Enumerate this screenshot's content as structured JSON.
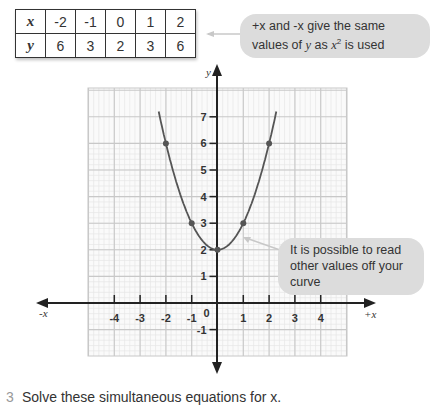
{
  "table": {
    "x_label": "x",
    "y_label": "y",
    "x_values": [
      "-2",
      "-1",
      "0",
      "1",
      "2"
    ],
    "y_values": [
      "6",
      "3",
      "2",
      "3",
      "6"
    ]
  },
  "callouts": {
    "symmetry_pre": "+x and -x give the same values of ",
    "symmetry_y": "y",
    "symmetry_mid": " as ",
    "symmetry_x": "x",
    "symmetry_sup": "2",
    "symmetry_post": " is used",
    "read_values": "It is possible to read other values off your curve"
  },
  "axes": {
    "x_pos_label": "+x",
    "x_neg_label": "-x",
    "y_label": "y",
    "x_ticks": [
      "-4",
      "-3",
      "-2",
      "-1",
      "0",
      "1",
      "2",
      "3",
      "4"
    ],
    "y_ticks": [
      "-1",
      "1",
      "2",
      "3",
      "4",
      "5",
      "6",
      "7"
    ]
  },
  "question": {
    "number": "3",
    "text": "Solve these simultaneous equations for x."
  },
  "colors": {
    "curve": "#555555",
    "axis": "#222222",
    "grid_major": "#c8c8c8",
    "grid_minor": "#e6e6e6",
    "callout_bg": "#dcdcdc"
  },
  "chart_data": {
    "type": "line",
    "title": "",
    "function": "y = x^2 + 2",
    "xlabel": "x",
    "ylabel": "y",
    "x": [
      -2,
      -1,
      0,
      1,
      2
    ],
    "y": [
      6,
      3,
      2,
      3,
      6
    ],
    "points_marked": [
      [
        -2,
        6
      ],
      [
        -1,
        3
      ],
      [
        0,
        2
      ],
      [
        1,
        3
      ],
      [
        2,
        6
      ]
    ],
    "xlim": [
      -5,
      5
    ],
    "ylim": [
      -2,
      8
    ],
    "x_ticks": [
      -4,
      -3,
      -2,
      -1,
      0,
      1,
      2,
      3,
      4
    ],
    "y_ticks": [
      -1,
      1,
      2,
      3,
      4,
      5,
      6,
      7
    ],
    "grid": true,
    "annotations": [
      "+x and -x give the same values of y as x² is used",
      "It is possible to read other values off your curve"
    ]
  }
}
